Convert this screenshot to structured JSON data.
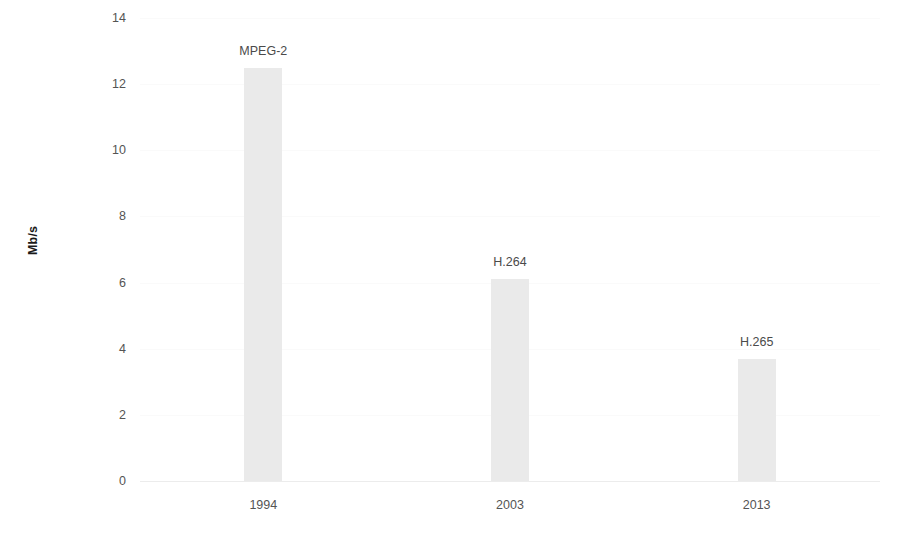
{
  "chart_data": {
    "type": "bar",
    "title": "",
    "subtitle": "",
    "xlabel": "",
    "ylabel": "Mb/s",
    "categories": [
      "1994",
      "2003",
      "2013"
    ],
    "values": [
      12.5,
      6.1,
      3.7
    ],
    "point_labels": [
      "MPEG-2",
      "H.264",
      "H.265"
    ],
    "series": [
      {
        "name": "Bitrate",
        "values": [
          12.5,
          6.1,
          3.7
        ]
      }
    ],
    "ylim": [
      0,
      14
    ],
    "yticks": [
      0,
      2,
      4,
      6,
      8,
      10,
      12,
      14
    ],
    "ytick_labels": [
      "0",
      "2",
      "4",
      "6",
      "8",
      "10",
      "12",
      "14"
    ],
    "xtick_labels": [
      "1994",
      "2003",
      "2013"
    ],
    "grid": true,
    "grid_axis": "y",
    "legend": false,
    "legend_position": "none",
    "bar_color": "#eaeaea",
    "axis_color": "#ececec",
    "grid_color": "#fafafa",
    "tick_text_color": "#545454",
    "label_text_color": "#4a4a4a",
    "axis_title_color": "#1a1a1a",
    "background_color": "#ffffff"
  }
}
